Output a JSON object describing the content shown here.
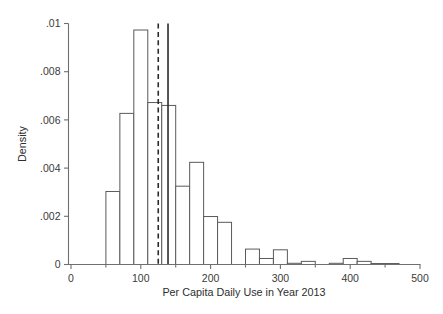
{
  "chart_data": {
    "type": "bar",
    "title": "",
    "subtitle": "",
    "xlabel": "Per Capita Daily Use in Year 2013",
    "ylabel": "Density",
    "xlim": [
      0,
      500
    ],
    "ylim": [
      0,
      0.01
    ],
    "grid": false,
    "legend": null,
    "bin_width": 20,
    "x_tick_labels": [
      "0",
      "100",
      "200",
      "300",
      "400",
      "500"
    ],
    "x_tick_values": [
      0,
      100,
      200,
      300,
      400,
      500
    ],
    "x_minor_tick_values": [
      50,
      150,
      250,
      350,
      450
    ],
    "y_tick_labels": [
      "0",
      ".002",
      ".004",
      ".006",
      ".008",
      ".01"
    ],
    "y_tick_values": [
      0,
      0.002,
      0.004,
      0.006,
      0.008,
      0.01
    ],
    "bins": [
      {
        "x0": 50,
        "x1": 70,
        "density": 0.00303
      },
      {
        "x0": 70,
        "x1": 90,
        "density": 0.00627
      },
      {
        "x0": 90,
        "x1": 110,
        "density": 0.00973
      },
      {
        "x0": 110,
        "x1": 130,
        "density": 0.00672
      },
      {
        "x0": 130,
        "x1": 150,
        "density": 0.0066
      },
      {
        "x0": 150,
        "x1": 170,
        "density": 0.00325
      },
      {
        "x0": 170,
        "x1": 190,
        "density": 0.00424
      },
      {
        "x0": 190,
        "x1": 210,
        "density": 0.00199
      },
      {
        "x0": 210,
        "x1": 230,
        "density": 0.00175
      },
      {
        "x0": 230,
        "x1": 250,
        "density": 0.0
      },
      {
        "x0": 250,
        "x1": 270,
        "density": 0.00064
      },
      {
        "x0": 270,
        "x1": 290,
        "density": 0.00025
      },
      {
        "x0": 290,
        "x1": 310,
        "density": 0.00061
      },
      {
        "x0": 310,
        "x1": 330,
        "density": 5e-05
      },
      {
        "x0": 330,
        "x1": 350,
        "density": 0.00013
      },
      {
        "x0": 370,
        "x1": 390,
        "density": 5e-05
      },
      {
        "x0": 390,
        "x1": 410,
        "density": 0.00025
      },
      {
        "x0": 410,
        "x1": 430,
        "density": 0.00013
      },
      {
        "x0": 430,
        "x1": 450,
        "density": 4e-05
      },
      {
        "x0": 450,
        "x1": 470,
        "density": 4e-05
      }
    ],
    "reference_lines": [
      {
        "name": "mean-line-dashed",
        "x": 125,
        "style": "dashed"
      },
      {
        "name": "median-line-solid",
        "x": 139,
        "style": "solid"
      }
    ],
    "colors": {
      "bar_fill": "#ffffff",
      "bar_stroke": "#5a5a5a",
      "axis": "#6f6f6f",
      "reference_line": "#2b2b2b",
      "text": "#3a3a3a",
      "background": "#ffffff"
    }
  }
}
